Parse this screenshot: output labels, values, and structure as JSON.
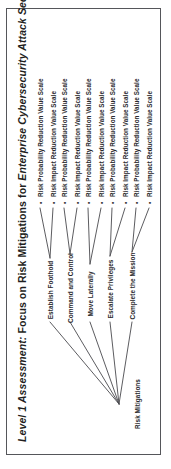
{
  "figure": {
    "title": {
      "part1": "Level 1 Assessment:",
      "part2": " Focus on Risk Mitigations for ",
      "part3": "Enterprise Cybersecurity Attack Sequence"
    },
    "orientation": "rotated-90-ccw",
    "colors": {
      "border": "#55565a",
      "text": "#2a2a2d",
      "line": "#4a4a4e",
      "background": "#ffffff"
    }
  },
  "tree": {
    "root": {
      "label": "Risk Mitigations"
    },
    "bullet": "•",
    "stages": [
      {
        "label": "Establish Foothold",
        "leaves": [
          "Risk Probability Reduction Value Scale",
          "Risk Impact Reduction Value Scale"
        ]
      },
      {
        "label": "Command and Control",
        "leaves": [
          "Risk Probability Reduction Value Scale",
          "Risk Impact Reduction Value Scale"
        ]
      },
      {
        "label": "Move Laterally",
        "leaves": [
          "Risk Probability Reduction Value Scale",
          "Risk Impact Reduction Value Scale"
        ]
      },
      {
        "label": "Escalate Privileges",
        "leaves": [
          "Risk Probability Reduction Value Scale",
          "Risk Impact Reduction Value Scale"
        ]
      },
      {
        "label": "Complete the Mission",
        "leaves": [
          "Risk Probability Reduction Value Scale",
          "Risk Impact Reduction Value Scale"
        ]
      }
    ]
  }
}
